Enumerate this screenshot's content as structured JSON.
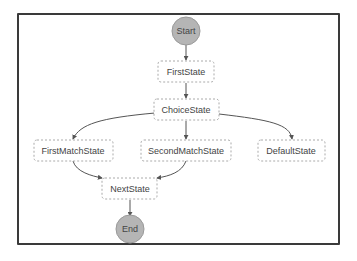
{
  "diagram": {
    "type": "state-machine",
    "nodes": [
      {
        "id": "start",
        "label": "Start",
        "kind": "terminal"
      },
      {
        "id": "first",
        "label": "FirstState",
        "kind": "state"
      },
      {
        "id": "choice",
        "label": "ChoiceState",
        "kind": "state"
      },
      {
        "id": "firstmatch",
        "label": "FirstMatchState",
        "kind": "state"
      },
      {
        "id": "secondmatch",
        "label": "SecondMatchState",
        "kind": "state"
      },
      {
        "id": "default",
        "label": "DefaultState",
        "kind": "state"
      },
      {
        "id": "next",
        "label": "NextState",
        "kind": "state"
      },
      {
        "id": "end",
        "label": "End",
        "kind": "terminal"
      }
    ],
    "edges": [
      {
        "from": "start",
        "to": "first"
      },
      {
        "from": "first",
        "to": "choice"
      },
      {
        "from": "choice",
        "to": "firstmatch"
      },
      {
        "from": "choice",
        "to": "secondmatch"
      },
      {
        "from": "choice",
        "to": "default"
      },
      {
        "from": "firstmatch",
        "to": "next"
      },
      {
        "from": "secondmatch",
        "to": "next"
      },
      {
        "from": "next",
        "to": "end"
      }
    ],
    "colors": {
      "terminal_fill": "#b3b3b3",
      "terminal_stroke": "#999999",
      "state_stroke": "#aaaaaa",
      "edge": "#555555",
      "frame": "#3a3a3a"
    }
  }
}
